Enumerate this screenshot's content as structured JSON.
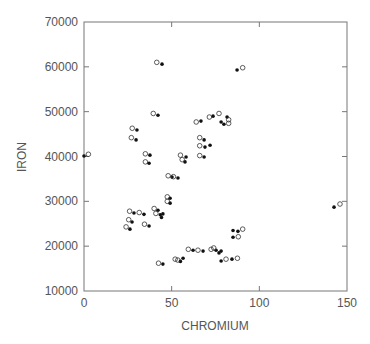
{
  "chart_data": {
    "type": "scatter",
    "title": "",
    "xlabel": "CHROMIUM",
    "ylabel": "IRON",
    "xlim": [
      0,
      150
    ],
    "ylim": [
      10000,
      70000
    ],
    "x_ticks": [
      0,
      50,
      100,
      150
    ],
    "y_ticks": [
      10000,
      20000,
      30000,
      40000,
      50000,
      60000,
      70000
    ],
    "x_tick_labels": [
      "0",
      "50",
      "100",
      "150"
    ],
    "y_tick_labels": [
      "10000",
      "20000",
      "30000",
      "40000",
      "50000",
      "60000",
      "70000"
    ],
    "grid": false,
    "legend": null,
    "series": [
      {
        "name": "filled",
        "marker": "filled-dot",
        "color": "#111111",
        "points": [
          [
            44.5,
            60600
          ],
          [
            87.3,
            59300
          ],
          [
            42.2,
            49200
          ],
          [
            30.2,
            45900
          ],
          [
            29.7,
            43700
          ],
          [
            37.6,
            40300
          ],
          [
            37.1,
            38500
          ],
          [
            0.0,
            40100
          ],
          [
            58.2,
            39900
          ],
          [
            57.6,
            38800
          ],
          [
            53.6,
            35200
          ],
          [
            50.2,
            35400
          ],
          [
            49.1,
            30700
          ],
          [
            49.1,
            29600
          ],
          [
            28.5,
            27400
          ],
          [
            34.2,
            27100
          ],
          [
            27.4,
            25400
          ],
          [
            26.2,
            23800
          ],
          [
            37.1,
            24500
          ],
          [
            42.2,
            28000
          ],
          [
            43.5,
            27000
          ],
          [
            44.2,
            26400
          ],
          [
            45.0,
            27200
          ],
          [
            45.0,
            16000
          ],
          [
            56.5,
            17300
          ],
          [
            55.0,
            16600
          ],
          [
            62.2,
            19100
          ],
          [
            67.9,
            18900
          ],
          [
            75.3,
            19100
          ],
          [
            78.2,
            18900
          ],
          [
            77.0,
            18500
          ],
          [
            78.2,
            16700
          ],
          [
            84.4,
            17100
          ],
          [
            85.0,
            22000
          ],
          [
            87.8,
            23300
          ],
          [
            85.0,
            23500
          ],
          [
            142.6,
            28700
          ],
          [
            66.7,
            47900
          ],
          [
            73.6,
            49000
          ],
          [
            78.2,
            47700
          ],
          [
            79.8,
            47200
          ],
          [
            81.6,
            48800
          ],
          [
            68.5,
            43700
          ],
          [
            69.0,
            42100
          ],
          [
            71.9,
            42500
          ],
          [
            68.5,
            39900
          ]
        ]
      },
      {
        "name": "open",
        "marker": "open-circle",
        "color": "#333333",
        "points": [
          [
            41.5,
            61000
          ],
          [
            90.5,
            59800
          ],
          [
            39.5,
            49600
          ],
          [
            27.5,
            46300
          ],
          [
            27.0,
            44200
          ],
          [
            35.0,
            40600
          ],
          [
            35.0,
            38800
          ],
          [
            2.5,
            40500
          ],
          [
            55.0,
            40300
          ],
          [
            56.0,
            39300
          ],
          [
            51.0,
            35500
          ],
          [
            48.0,
            35700
          ],
          [
            47.5,
            31000
          ],
          [
            47.5,
            30000
          ],
          [
            26.0,
            27800
          ],
          [
            31.5,
            27500
          ],
          [
            25.5,
            25900
          ],
          [
            24.0,
            24300
          ],
          [
            34.5,
            24900
          ],
          [
            40.0,
            28400
          ],
          [
            41.0,
            27300
          ],
          [
            42.5,
            16200
          ],
          [
            52.0,
            17100
          ],
          [
            53.5,
            16900
          ],
          [
            59.5,
            19300
          ],
          [
            65.0,
            19100
          ],
          [
            72.5,
            19300
          ],
          [
            74.0,
            19600
          ],
          [
            81.0,
            17100
          ],
          [
            87.5,
            17300
          ],
          [
            88.0,
            22100
          ],
          [
            90.5,
            23800
          ],
          [
            146.0,
            29400
          ],
          [
            64.0,
            47700
          ],
          [
            71.5,
            48800
          ],
          [
            77.0,
            49600
          ],
          [
            82.5,
            47400
          ],
          [
            82.5,
            48200
          ],
          [
            66.0,
            44200
          ],
          [
            66.0,
            42400
          ],
          [
            66.0,
            40200
          ]
        ]
      }
    ]
  },
  "axes": {
    "x_title": "CHROMIUM",
    "y_title": "IRON"
  }
}
